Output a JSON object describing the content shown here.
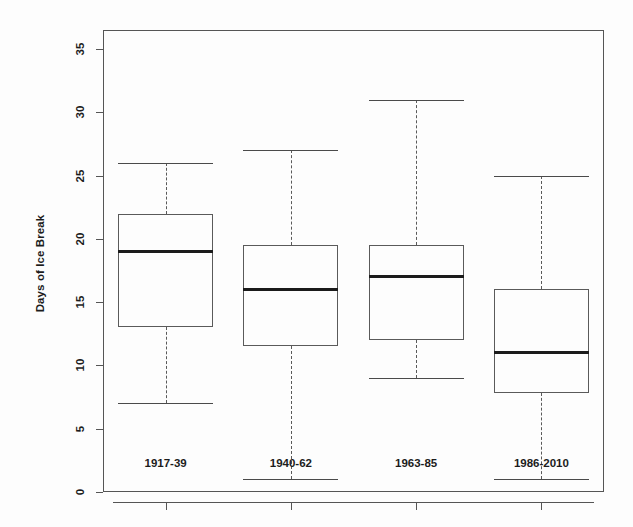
{
  "chart_data": {
    "type": "box",
    "title": "",
    "xlabel": "",
    "ylabel": "Days of Ice Break",
    "ylim": [
      0,
      36.5
    ],
    "yticks": [
      0,
      5,
      10,
      15,
      20,
      25,
      30,
      35
    ],
    "ytick_labels": [
      "0",
      "5",
      "10",
      "15",
      "20",
      "25",
      "30",
      "35"
    ],
    "grid": false,
    "legend": "none",
    "categories": [
      "1917-39",
      "1940-62",
      "1963-85",
      "1986-2010"
    ],
    "boxes": [
      {
        "category": "1917-39",
        "whisker_low": 7,
        "q1": 13,
        "median": 19,
        "q3": 22,
        "whisker_high": 26
      },
      {
        "category": "1940-62",
        "whisker_low": 1,
        "q1": 11.5,
        "median": 16,
        "q3": 19.5,
        "whisker_high": 27
      },
      {
        "category": "1963-85",
        "whisker_low": 9,
        "q1": 12,
        "median": 17,
        "q3": 19.5,
        "whisker_high": 31
      },
      {
        "category": "1986-2010",
        "whisker_low": 1,
        "q1": 7.8,
        "median": 11,
        "q3": 16,
        "whisker_high": 25
      }
    ],
    "colors": {
      "box_border": "#5a5a5a",
      "median": "#1b1b1b",
      "whisker": "#5a5a5a",
      "axis": "#555555",
      "background": "#fdfdfd",
      "text": "#1c1c1c"
    }
  }
}
